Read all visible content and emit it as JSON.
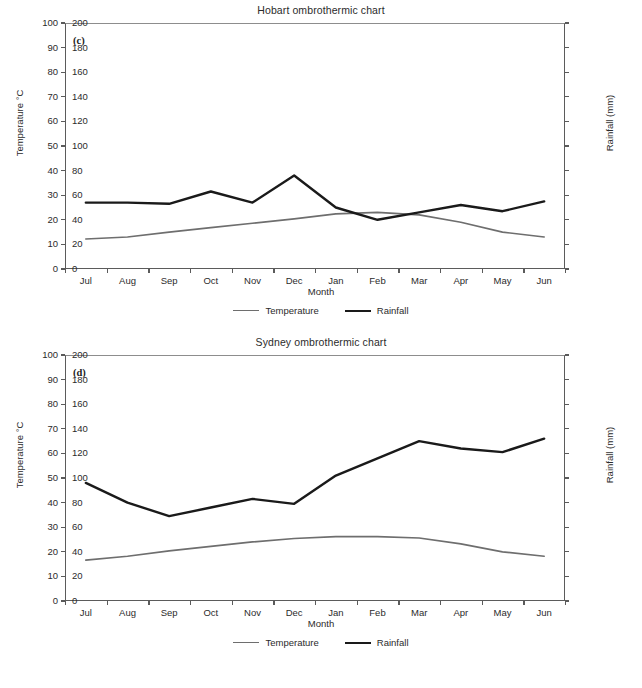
{
  "figures": [
    {
      "id": "c",
      "panel_label": "(c)",
      "title": "Hobart ombrothermic chart",
      "xlabel": "Month",
      "ylabel_left": "Temperature °C",
      "ylabel_right": "Rainfall (mm)",
      "legend": [
        {
          "label": "Temperature",
          "color": "#6e6e6e"
        },
        {
          "label": "Rainfall",
          "color": "#1a1a1a"
        }
      ],
      "categories": [
        "Jul",
        "Aug",
        "Sep",
        "Oct",
        "Nov",
        "Dec",
        "Jan",
        "Feb",
        "Mar",
        "Apr",
        "May",
        "Jun"
      ],
      "temperature": [
        12.2,
        13.0,
        15.0,
        16.8,
        18.6,
        20.4,
        22.4,
        23.0,
        22.0,
        19.0,
        15.0,
        13.0
      ],
      "rainfall_mm": [
        54,
        54,
        53,
        63,
        54,
        76,
        50,
        40,
        46,
        52,
        47,
        55
      ],
      "ylim_left": [
        0,
        100
      ],
      "ylim_right": [
        0,
        200
      ],
      "ytick_step_left": 10,
      "ytick_step_right": 20
    },
    {
      "id": "d",
      "panel_label": "(d)",
      "title": "Sydney ombrothermic chart",
      "xlabel": "Month",
      "ylabel_left": "Temperature °C",
      "ylabel_right": "Rainfall (mm)",
      "legend": [
        {
          "label": "Temperature",
          "color": "#6e6e6e"
        },
        {
          "label": "Rainfall",
          "color": "#1a1a1a"
        }
      ],
      "categories": [
        "Jul",
        "Aug",
        "Sep",
        "Oct",
        "Nov",
        "Dec",
        "Jan",
        "Feb",
        "Mar",
        "Apr",
        "May",
        "Jun"
      ],
      "temperature": [
        16.6,
        18.2,
        20.4,
        22.2,
        24.0,
        25.4,
        26.2,
        26.2,
        25.6,
        23.2,
        20.0,
        18.2
      ],
      "rainfall_mm": [
        96,
        80,
        69,
        76,
        83,
        79,
        102,
        116,
        130,
        124,
        121,
        132
      ],
      "ylim_left": [
        0,
        100
      ],
      "ylim_right": [
        0,
        200
      ],
      "ytick_step_left": 10,
      "ytick_step_right": 20
    }
  ],
  "chart_data": [
    {
      "type": "line",
      "title": "Hobart ombrothermic chart",
      "panel": "(c)",
      "xlabel": "Month",
      "ylabel": "Temperature °C",
      "ylabel_secondary": "Rainfall (mm)",
      "categories": [
        "Jul",
        "Aug",
        "Sep",
        "Oct",
        "Nov",
        "Dec",
        "Jan",
        "Feb",
        "Mar",
        "Apr",
        "May",
        "Jun"
      ],
      "series": [
        {
          "name": "Temperature",
          "axis": "left",
          "unit": "°C",
          "values": [
            12.2,
            13.0,
            15.0,
            16.8,
            18.6,
            20.4,
            22.4,
            23.0,
            22.0,
            19.0,
            15.0,
            13.0
          ]
        },
        {
          "name": "Rainfall",
          "axis": "right",
          "unit": "mm",
          "values": [
            54,
            54,
            53,
            63,
            54,
            76,
            50,
            40,
            46,
            52,
            47,
            55
          ]
        }
      ],
      "ylim": [
        0,
        100
      ],
      "ylim_secondary": [
        0,
        200
      ],
      "grid": false,
      "legend_position": "bottom"
    },
    {
      "type": "line",
      "title": "Sydney ombrothermic chart",
      "panel": "(d)",
      "xlabel": "Month",
      "ylabel": "Temperature °C",
      "ylabel_secondary": "Rainfall (mm)",
      "categories": [
        "Jul",
        "Aug",
        "Sep",
        "Oct",
        "Nov",
        "Dec",
        "Jan",
        "Feb",
        "Mar",
        "Apr",
        "May",
        "Jun"
      ],
      "series": [
        {
          "name": "Temperature",
          "axis": "left",
          "unit": "°C",
          "values": [
            16.6,
            18.2,
            20.4,
            22.2,
            24.0,
            25.4,
            26.2,
            26.2,
            25.6,
            23.2,
            20.0,
            18.2
          ]
        },
        {
          "name": "Rainfall",
          "axis": "right",
          "unit": "mm",
          "values": [
            96,
            80,
            69,
            76,
            83,
            79,
            102,
            116,
            130,
            124,
            121,
            132
          ]
        }
      ],
      "ylim": [
        0,
        100
      ],
      "ylim_secondary": [
        0,
        200
      ],
      "grid": false,
      "legend_position": "bottom"
    }
  ]
}
